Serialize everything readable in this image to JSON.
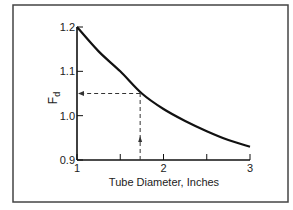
{
  "chart_data": {
    "type": "line",
    "title": "",
    "xlabel": "Tube Diameter, Inches",
    "ylabel": "Fd",
    "ylabel_main": "F",
    "ylabel_sub": "d",
    "xlim": [
      1,
      3
    ],
    "ylim": [
      0.9,
      1.2
    ],
    "x_ticks": [
      1,
      2,
      3
    ],
    "x_tick_labels": [
      "1",
      "2",
      "3"
    ],
    "x_minor_ticks": [
      1.5,
      2.5
    ],
    "y_ticks": [
      0.9,
      1.0,
      1.1,
      1.2
    ],
    "y_tick_labels": [
      "0.9",
      "1.0",
      "1.1",
      "1.2"
    ],
    "grid": false,
    "series": [
      {
        "name": "Fd",
        "x": [
          1.0,
          1.25,
          1.5,
          1.75,
          2.0,
          2.25,
          2.5,
          2.75,
          3.0
        ],
        "values": [
          1.2,
          1.145,
          1.1,
          1.05,
          1.015,
          0.988,
          0.965,
          0.945,
          0.93
        ]
      }
    ],
    "annotations": [
      {
        "type": "dashed-reference",
        "x": 1.73,
        "y": 1.05,
        "description": "Dashed lines from x≈1.73 up to curve and left to y-axis at Fd≈1.05, with arrows"
      }
    ]
  }
}
